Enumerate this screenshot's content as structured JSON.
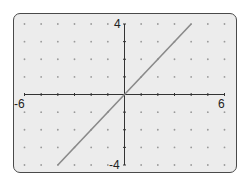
{
  "chart_data": {
    "type": "line",
    "title": "",
    "xlabel": "",
    "ylabel": "",
    "xlim": [
      -6,
      6
    ],
    "ylim": [
      -4,
      4
    ],
    "grid": "dots",
    "tick_labels": {
      "x_min": "-6",
      "x_max": "6",
      "y_max": "4",
      "y_min": "-4"
    },
    "series": [
      {
        "name": "y = x",
        "x": [
          -4,
          4
        ],
        "y": [
          -4,
          4
        ],
        "color": "#8a8a8a"
      }
    ]
  },
  "colors": {
    "screen_bg": "#ececec",
    "frame": "#4a4a4a",
    "axis": "#333333",
    "dot": "#9a9a9a",
    "line": "#8a8a8a"
  }
}
